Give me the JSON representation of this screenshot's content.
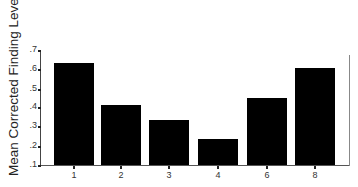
{
  "chart_data": {
    "type": "bar",
    "title": "",
    "xlabel": "",
    "ylabel": "Mean Corrected Finding Level r",
    "categories": [
      "1",
      "2",
      "3",
      "4",
      "6",
      "8"
    ],
    "values": [
      0.627,
      0.41,
      0.335,
      0.234,
      0.448,
      0.605
    ],
    "ylim": [
      0.1,
      0.7
    ],
    "yticks": [
      ".1",
      ".2",
      ".3",
      ".4",
      ".5",
      ".6",
      ".7"
    ],
    "grid": false,
    "legend": null,
    "bar_color": "#000000"
  }
}
